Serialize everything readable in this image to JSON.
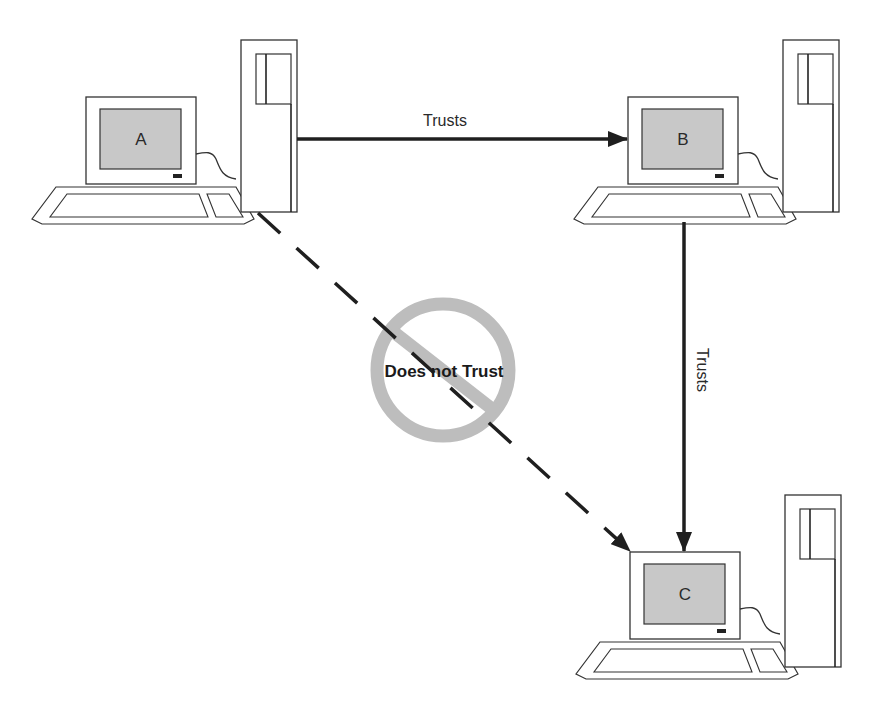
{
  "diagram": {
    "type": "trust-relationship",
    "colors": {
      "line": "#1f1f1f",
      "screen_fill": "#c8c8c8",
      "prohibit": "#bdbdbd",
      "outline": "#333333"
    },
    "nodes": [
      {
        "id": "A",
        "label": "A"
      },
      {
        "id": "B",
        "label": "B"
      },
      {
        "id": "C",
        "label": "C"
      }
    ],
    "edges": [
      {
        "from": "A",
        "to": "B",
        "label": "Trusts",
        "style": "solid"
      },
      {
        "from": "B",
        "to": "C",
        "label": "Trusts",
        "style": "solid"
      },
      {
        "from": "A",
        "to": "C",
        "label": "Does not Trust",
        "style": "dashed",
        "icon": "prohibition-icon"
      }
    ]
  }
}
